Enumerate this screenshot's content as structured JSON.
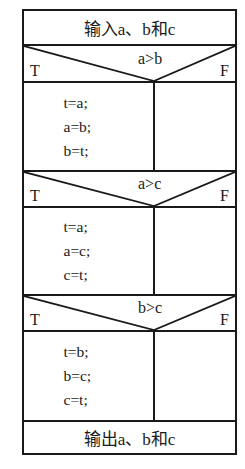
{
  "diagram": {
    "type": "nassi-shneiderman",
    "input": "输入a、b和c",
    "decisions": [
      {
        "condition": "a>b",
        "true_label": "T",
        "false_label": "F",
        "true_branch": [
          "t=a;",
          "a=b;",
          "b=t;"
        ],
        "false_branch": []
      },
      {
        "condition": "a>c",
        "true_label": "T",
        "false_label": "F",
        "true_branch": [
          "t=a;",
          "a=c;",
          "c=t;"
        ],
        "false_branch": []
      },
      {
        "condition": "b>c",
        "true_label": "T",
        "false_label": "F",
        "true_branch": [
          "t=b;",
          "b=c;",
          "c=t;"
        ],
        "false_branch": []
      }
    ],
    "output": "输出a、b和c"
  }
}
